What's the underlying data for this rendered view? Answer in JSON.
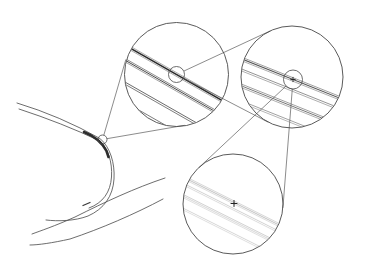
{
  "figure": {
    "width": 365,
    "height": 270,
    "background": "#ffffff",
    "line_color": "#474747",
    "connector_color": "#5a5a5a",
    "dark_color": "#222222"
  },
  "base_curve": {
    "stroke_width": 0.8,
    "paths": [
      {
        "name": "upper-branch-outer-curve",
        "d": "M 17 103 Q 60 116 100 138.5"
      },
      {
        "name": "upper-branch-inner-curve",
        "d": "M 19 109 Q 62 123 100 141"
      },
      {
        "name": "right-branch-outer-curve",
        "d": "M 100.5 139 C 110 147 115 163 114 179 C 113 196 104 209 88 216 C 75 221 58 221.5 46 220"
      },
      {
        "name": "right-branch-inner-curve",
        "d": "M 99.5 140.5 C 108 148 112.5 162 111.5 177 C 110.5 192 103 203 89 208"
      },
      {
        "name": "middle-sweep-curve",
        "d": "M 165 178 C 135 188 105 202 75 217 C 55 226 40 231 32 234"
      },
      {
        "name": "lower-sweep-curve",
        "d": "M 163 199 C 135 214 100 229 70 239 C 52 243 38 245 30 245"
      }
    ],
    "thick_segment": {
      "d": "M 84 132 C 94 136 102 142 106.5 151 L 108.5 157",
      "width": 2.6,
      "color": "#2d2d2d"
    },
    "end_dash": {
      "d": "M 83 205.5 L 90 202.5",
      "width": 1.3,
      "color": "#3a3a3a"
    }
  },
  "source_circle": {
    "cx": 102.5,
    "cy": 139.5,
    "r": 4.5,
    "stroke_width": 0.8
  },
  "magnifiers": [
    {
      "id": "upper-left",
      "cx": 176.5,
      "cy": 74.5,
      "r": 52,
      "outline_width": 0.9,
      "slope": 0.57,
      "ref": [
        176.5,
        74.5
      ],
      "bands": [
        {
          "dy": 0,
          "strands": [
            {
              "o": -1.9,
              "w": 0.7,
              "color": "#8a8a8a"
            },
            {
              "o": 0,
              "w": 1.6,
              "color": "#2b2b2b"
            },
            {
              "o": 1.9,
              "w": 0.7,
              "color": "#8a8a8a"
            }
          ]
        },
        {
          "dy": 15,
          "strands": [
            {
              "o": -1.7,
              "w": 0.7,
              "color": "#5a5a5a"
            },
            {
              "o": 0,
              "w": 0.9,
              "color": "#333333"
            },
            {
              "o": 1.7,
              "w": 0.7,
              "color": "#7a7a7a"
            }
          ]
        },
        {
          "dy": 38,
          "strands": [
            {
              "o": -1.1,
              "w": 0.8,
              "color": "#454545"
            },
            {
              "o": 1.1,
              "w": 0.8,
              "color": "#5c5c5c"
            }
          ]
        },
        {
          "dy": 57,
          "strands": [
            {
              "o": 0,
              "w": 0.8,
              "color": "#5a5a5a"
            }
          ]
        }
      ],
      "inner_circle": {
        "cx": 176.5,
        "cy": 74.5,
        "r": 8
      },
      "plus": null
    },
    {
      "id": "upper-right",
      "cx": 292,
      "cy": 77,
      "r": 51,
      "outline_width": 0.9,
      "slope": 0.4,
      "ref": [
        293,
        79.5
      ],
      "bands": [
        {
          "dy": 0,
          "strands": [
            {
              "o": -1.8,
              "w": 0.7,
              "color": "#787878"
            },
            {
              "o": 0,
              "w": 1.1,
              "color": "#555555"
            },
            {
              "o": 1.8,
              "w": 0.7,
              "color": "#8a8a8a"
            }
          ]
        },
        {
          "dy": 11,
          "strands": [
            {
              "o": -1.0,
              "w": 0.7,
              "color": "#666666"
            },
            {
              "o": 1.0,
              "w": 0.7,
              "color": "#8d8d8d"
            }
          ]
        },
        {
          "dy": 27,
          "strands": [
            {
              "o": -1.8,
              "w": 0.7,
              "color": "#787878"
            },
            {
              "o": 0,
              "w": 0.8,
              "color": "#565656"
            },
            {
              "o": 1.8,
              "w": 0.7,
              "color": "#8d8d8d"
            }
          ]
        },
        {
          "dy": 43,
          "strands": [
            {
              "o": -1.0,
              "w": 0.7,
              "color": "#7a7a7a"
            },
            {
              "o": 1.0,
              "w": 0.7,
              "color": "#989898"
            }
          ]
        }
      ],
      "inner_circle": {
        "cx": 293,
        "cy": 79.5,
        "r": 9.5
      },
      "plus": {
        "x": 293,
        "y": 79.5,
        "size": 2.6,
        "width": 0.9
      }
    },
    {
      "id": "bottom",
      "cx": 233,
      "cy": 204,
      "r": 50,
      "outline_width": 0.9,
      "slope": 0.5,
      "ref": [
        234,
        203.5
      ],
      "bands": [
        {
          "dy": -1,
          "strands": [
            {
              "o": -1.6,
              "w": 0.6,
              "color": "#b8b8b8"
            },
            {
              "o": 0,
              "w": 0.7,
              "color": "#a6a6a6"
            },
            {
              "o": 1.6,
              "w": 0.6,
              "color": "#c2c2c2"
            }
          ]
        },
        {
          "dy": 6,
          "strands": [
            {
              "o": -0.9,
              "w": 0.6,
              "color": "#b4b4b4"
            },
            {
              "o": 0.9,
              "w": 0.6,
              "color": "#c4c4c4"
            }
          ]
        },
        {
          "dy": 18,
          "strands": [
            {
              "o": -1.6,
              "w": 0.6,
              "color": "#aeaeae"
            },
            {
              "o": 0,
              "w": 0.6,
              "color": "#bcbcbc"
            },
            {
              "o": 1.6,
              "w": 0.6,
              "color": "#c8c8c8"
            }
          ]
        },
        {
          "dy": 31,
          "strands": [
            {
              "o": -0.9,
              "w": 0.6,
              "color": "#bababa"
            },
            {
              "o": 0.9,
              "w": 0.6,
              "color": "#cacaca"
            }
          ]
        }
      ],
      "inner_circle": null,
      "plus": {
        "x": 234,
        "y": 203.5,
        "size": 3.4,
        "width": 1.0
      }
    }
  ],
  "connectors": {
    "width": 0.7,
    "lines": [
      {
        "name": "tangent-source-to-upper-left-a",
        "x1": 103.8,
        "y1": 135.2,
        "x2": 125.9,
        "y2": 59.4
      },
      {
        "name": "tangent-source-to-upper-left-b",
        "x1": 106.9,
        "y1": 138.7,
        "x2": 184.7,
        "y2": 125.3
      },
      {
        "name": "tangent-upper-left-to-upper-right-a",
        "x1": 183.8,
        "y1": 71.1,
        "x2": 270.4,
        "y2": 30.8
      },
      {
        "name": "tangent-upper-left-to-upper-right-b",
        "x1": 183.6,
        "y1": 78.2,
        "x2": 268.4,
        "y2": 122.3
      },
      {
        "name": "tangent-upper-right-to-bottom-a",
        "x1": 286.1,
        "y1": 86.0,
        "x2": 199.0,
        "y2": 167.5
      },
      {
        "name": "tangent-upper-right-to-bottom-b",
        "x1": 292.3,
        "y1": 89.0,
        "x2": 282.9,
        "y2": 207.9
      }
    ]
  }
}
